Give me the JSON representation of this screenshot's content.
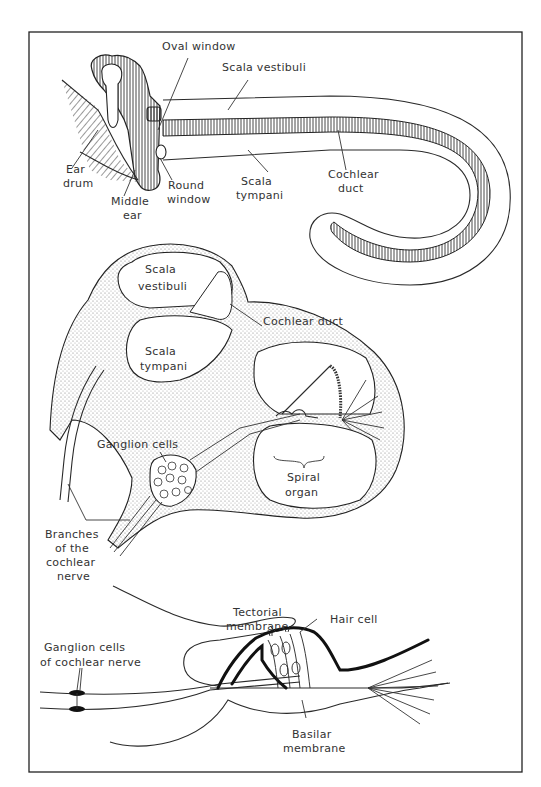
{
  "figure": {
    "colors": {
      "ink": "#2a2a2a",
      "label": "#333333",
      "background": "#ffffff",
      "stipple": "#8a8a8a"
    },
    "panels": [
      {
        "name": "uncoiled-cochlea",
        "labels": {
          "oval_window": "Oval window",
          "scala_vestibuli": "Scala vestibuli",
          "ear_drum_1": "Ear",
          "ear_drum_2": "drum",
          "middle_ear_1": "Middle",
          "middle_ear_2": "ear",
          "round_window_1": "Round",
          "round_window_2": "window",
          "scala_tympani_1": "Scala",
          "scala_tympani_2": "tympani",
          "cochlear_duct_1": "Cochlear",
          "cochlear_duct_2": "duct"
        }
      },
      {
        "name": "cochlea-cross-section",
        "labels": {
          "scala_vestibuli_1": "Scala",
          "scala_vestibuli_2": "vestibuli",
          "cochlear_duct": "Cochlear duct",
          "scala_tympani_1": "Scala",
          "scala_tympani_2": "tympani",
          "ganglion_cells": "Ganglion cells",
          "spiral_organ_1": "Spiral",
          "spiral_organ_2": "organ",
          "branches_1": "Branches",
          "branches_2": "of the",
          "branches_3": "cochlear",
          "branches_4": "nerve"
        }
      },
      {
        "name": "spiral-organ-detail",
        "labels": {
          "tectorial_1": "Tectorial",
          "tectorial_2": "membrane",
          "hair_cell": "Hair cell",
          "ganglion_1": "Ganglion cells",
          "ganglion_2": "of cochlear nerve",
          "basilar_1": "Basilar",
          "basilar_2": "membrane"
        }
      }
    ]
  }
}
